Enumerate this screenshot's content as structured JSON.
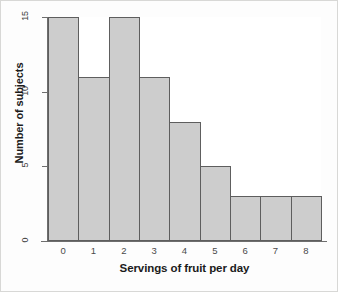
{
  "chart_data": {
    "type": "bar",
    "title": "",
    "xlabel": "Servings of fruit per day",
    "ylabel": "Number of subjects",
    "categories": [
      "0",
      "1",
      "2",
      "3",
      "4",
      "5",
      "6",
      "7",
      "8"
    ],
    "values": [
      15,
      11,
      15,
      11,
      8,
      5,
      3,
      3,
      3
    ],
    "ylim": [
      0,
      15
    ],
    "yticks": [
      0,
      5,
      10,
      15
    ],
    "ytick_labels": [
      "0",
      "5",
      "10",
      "15"
    ],
    "xtick_labels": [
      "0",
      "1",
      "2",
      "3",
      "4",
      "5",
      "6",
      "7",
      "8"
    ],
    "grid": false,
    "legend": null,
    "bar_fill_color": "#cdcdcd",
    "bar_border_color": "#5e5e5e",
    "axis_color": "#6e6e6e",
    "plot_background": "#ffffff",
    "figure_background": "#fdfdfd",
    "figure_border_color": "#d8d8d6"
  }
}
